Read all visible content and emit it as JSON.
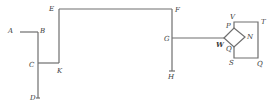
{
  "diagram": {
    "type": "circuit-line-diagram",
    "labels": {
      "A": "A",
      "B": "B",
      "C": "C",
      "D": "D",
      "E": "E",
      "F": "F",
      "G": "G",
      "H": "H",
      "K": "K",
      "W": "W",
      "P": "P",
      "N": "N",
      "Q_inner": "Q",
      "V": "V",
      "T": "T",
      "S": "S",
      "Q_outer": "Q"
    },
    "segments": [
      {
        "from": "A",
        "to": "B"
      },
      {
        "from": "B",
        "to": "D"
      },
      {
        "from": "C",
        "to": "K"
      },
      {
        "from": "K",
        "to": "E"
      },
      {
        "from": "E",
        "to": "F"
      },
      {
        "from": "F",
        "to": "H"
      },
      {
        "from": "G",
        "to": "W"
      },
      {
        "from": "W",
        "to": "P"
      },
      {
        "from": "P",
        "to": "N"
      },
      {
        "from": "N",
        "to": "Q"
      },
      {
        "from": "Q",
        "to": "W"
      },
      {
        "from": "P",
        "to": "V"
      },
      {
        "from": "V",
        "to": "T"
      },
      {
        "from": "T",
        "to": "Q_outer"
      },
      {
        "from": "Q_outer",
        "to": "S"
      },
      {
        "from": "S",
        "to": "Q"
      }
    ],
    "colors": {
      "line": "#6e6e6e",
      "text": "#3a3a3a",
      "background": "#ffffff"
    }
  }
}
